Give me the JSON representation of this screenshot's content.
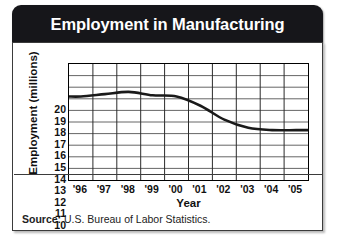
{
  "figure": {
    "title": "Employment in Manufacturing",
    "source_label": "Source:",
    "source_text": "U.S. Bureau of Labor Statistics.",
    "title_bar_color": "#16161a",
    "line_color": "#1a1a1a",
    "grid_color": "#555555",
    "panel_background": "#ffffff"
  },
  "chart_data": {
    "type": "line",
    "title": "Employment in Manufacturing",
    "xlabel": "Year",
    "ylabel": "Employment (millions)",
    "categories": [
      "'96",
      "'97",
      "'98",
      "'99",
      "'00",
      "'01",
      "'02",
      "'03",
      "'04",
      "'05"
    ],
    "x": [
      1996,
      1997,
      1998,
      1999,
      2000,
      2001,
      2002,
      2003,
      2004,
      2005
    ],
    "values": [
      17.2,
      17.4,
      17.6,
      17.3,
      17.2,
      16.4,
      15.2,
      14.5,
      14.3,
      14.3
    ],
    "ylim": [
      10,
      20
    ],
    "yticks": [
      20,
      19,
      18,
      17,
      16,
      15,
      14,
      13,
      12,
      11,
      10
    ],
    "ytick_labels": [
      "20",
      "19",
      "18",
      "17",
      "16",
      "15",
      "14",
      "13",
      "12",
      "11",
      "10"
    ],
    "grid": true,
    "legend": "none",
    "series": [
      {
        "name": "Employment (millions)",
        "values": [
          17.2,
          17.4,
          17.6,
          17.3,
          17.2,
          16.4,
          15.2,
          14.5,
          14.3,
          14.3
        ]
      }
    ]
  }
}
